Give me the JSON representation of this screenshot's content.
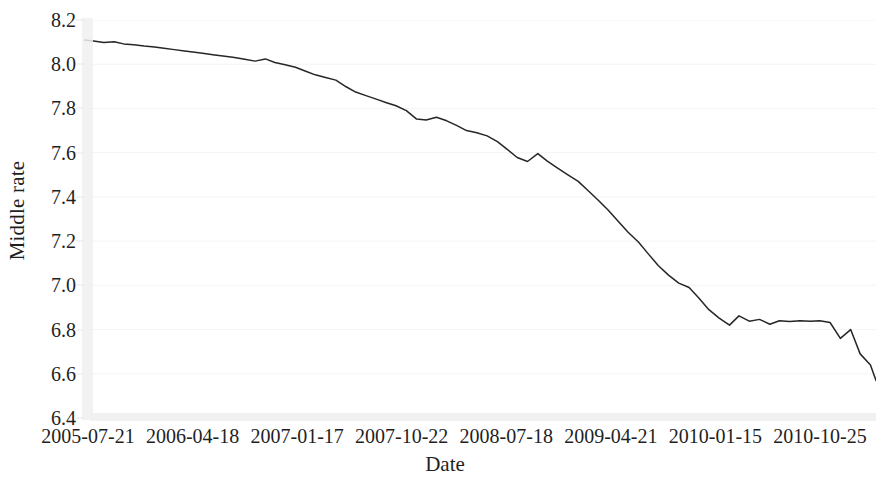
{
  "chart_data": {
    "type": "line",
    "title": "",
    "xlabel": "Date",
    "ylabel": "Middle rate",
    "grid": true,
    "legend": false,
    "ylim": [
      6.4,
      8.2
    ],
    "yticks": [
      "8.2",
      "8.0",
      "7.8",
      "7.6",
      "7.4",
      "7.2",
      "7.0",
      "6.8",
      "6.6",
      "6.4"
    ],
    "ytick_values": [
      8.2,
      8.0,
      7.8,
      7.6,
      7.4,
      7.2,
      7.0,
      6.8,
      6.6,
      6.4
    ],
    "xticks": [
      "2005-07-21",
      "2006-04-18",
      "2007-01-17",
      "2007-10-22",
      "2008-07-18",
      "2009-04-21",
      "2010-01-15",
      "2010-10-25"
    ],
    "xtick_positions": [
      0,
      1,
      2,
      3,
      4,
      5,
      6,
      7
    ],
    "series": [
      {
        "name": "Middle rate",
        "color": "#262626",
        "x": [
          0.0,
          0.012,
          0.025,
          0.038,
          0.05,
          0.063,
          0.076,
          0.089,
          0.101,
          0.114,
          0.127,
          0.14,
          0.152,
          0.165,
          0.178,
          0.19,
          0.203,
          0.216,
          0.229,
          0.241,
          0.254,
          0.267,
          0.28,
          0.292,
          0.305,
          0.318,
          0.331,
          0.343,
          0.356,
          0.369,
          0.382,
          0.394,
          0.407,
          0.42,
          0.432,
          0.445,
          0.458,
          0.471,
          0.483,
          0.496,
          0.509,
          0.522,
          0.534,
          0.547,
          0.56,
          0.573,
          0.585,
          0.598,
          0.611,
          0.624,
          0.636,
          0.649,
          0.662,
          0.675,
          0.687,
          0.7,
          0.713,
          0.725,
          0.738,
          0.751,
          0.764,
          0.776,
          0.789,
          0.802,
          0.815,
          0.827,
          0.84,
          0.853,
          0.866,
          0.878,
          0.891,
          0.904,
          0.917,
          0.929,
          0.942,
          0.955,
          0.968,
          0.98,
          0.993,
          1.0
        ],
        "values": [
          8.11,
          8.105,
          8.098,
          8.102,
          8.092,
          8.088,
          8.082,
          8.078,
          8.072,
          8.066,
          8.06,
          8.054,
          8.048,
          8.042,
          8.036,
          8.03,
          8.022,
          8.014,
          8.024,
          8.008,
          7.998,
          7.986,
          7.968,
          7.952,
          7.94,
          7.928,
          7.898,
          7.874,
          7.858,
          7.842,
          7.826,
          7.812,
          7.79,
          7.752,
          7.748,
          7.76,
          7.744,
          7.722,
          7.7,
          7.69,
          7.676,
          7.65,
          7.616,
          7.578,
          7.56,
          7.596,
          7.562,
          7.53,
          7.5,
          7.47,
          7.43,
          7.386,
          7.34,
          7.288,
          7.24,
          7.196,
          7.14,
          7.09,
          7.046,
          7.01,
          6.99,
          6.944,
          6.89,
          6.852,
          6.82,
          6.862,
          6.838,
          6.846,
          6.824,
          6.84,
          6.836,
          6.84,
          6.838,
          6.84,
          6.832,
          6.76,
          6.8,
          6.69,
          6.64,
          6.57
        ],
        "start_value": 8.11,
        "end_value": 6.57,
        "min_value": 6.57,
        "max_value": 8.11
      }
    ]
  }
}
